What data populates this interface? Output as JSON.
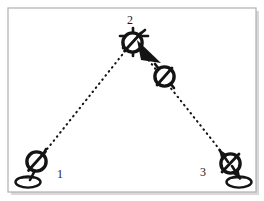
{
  "figure": {
    "kind": "surveying-traverse-diagram",
    "background_color": "#ffffff",
    "ink_color": "#141414",
    "frame": {
      "border_color": "#b0b0b0",
      "shadow_color": "#d9d9d9",
      "x": 8,
      "y": 8,
      "width": 248,
      "height": 184
    },
    "stations": [
      {
        "id": "station-1",
        "label": "1",
        "label_x": 60,
        "label_y": 178,
        "instrument_x": 36,
        "instrument_y": 161,
        "tripod_x": 28,
        "tripod_y": 182,
        "has_instrument": true,
        "has_tripod": true
      },
      {
        "id": "station-2",
        "label": "2",
        "label_x": 130,
        "label_y": 24,
        "instrument_x": 133,
        "instrument_y": 42,
        "tripod_x": 0,
        "tripod_y": 0,
        "has_instrument": true,
        "has_tripod": false
      },
      {
        "id": "station-3",
        "label": "3",
        "label_x": 203,
        "label_y": 176,
        "instrument_x": 231,
        "instrument_y": 163,
        "tripod_x": 239,
        "tripod_y": 182,
        "has_instrument": true,
        "has_tripod": true
      }
    ],
    "backsight_instrument": {
      "id": "foresight-instrument",
      "instrument_x": 164,
      "instrument_y": 76
    },
    "sight_lines": [
      {
        "id": "sight-line-1-to-2",
        "x1": 44,
        "y1": 153,
        "x2": 126,
        "y2": 50
      },
      {
        "id": "sight-line-2-to-3",
        "x1": 142,
        "y1": 52,
        "x2": 224,
        "y2": 155
      }
    ],
    "arrows": [
      {
        "id": "rotation-arrow-station-2",
        "tip_x": 160,
        "tip_y": 62,
        "tail_x": 136,
        "tail_y": 44
      },
      {
        "id": "arrow-up-station-3",
        "tip_x": 219,
        "tip_y": 150,
        "tail_x": 229,
        "tail_y": 164
      },
      {
        "id": "arrow-down-station-3",
        "tip_x": 240,
        "tip_y": 180,
        "tail_x": 231,
        "tail_y": 166
      }
    ]
  }
}
